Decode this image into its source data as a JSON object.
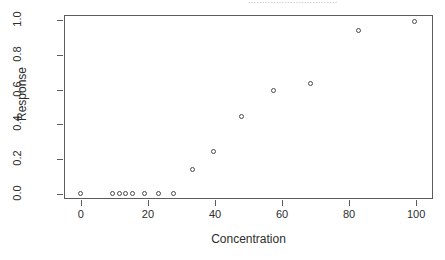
{
  "scan_header": {
    "text": "................................"
  },
  "chart_data": {
    "type": "scatter",
    "title": "",
    "xlabel": "Concentration",
    "ylabel": "Response",
    "xlim": [
      -5,
      105
    ],
    "ylim": [
      -0.03,
      1.03
    ],
    "xticks": [
      0,
      20,
      40,
      60,
      80,
      100
    ],
    "xticklabels": [
      "0",
      "20",
      "40",
      "60",
      "80",
      "100"
    ],
    "yticks": [
      0.0,
      0.2,
      0.4,
      0.6,
      0.8,
      1.0
    ],
    "yticklabels": [
      "0.0",
      "0.2",
      "0.4",
      "0.6",
      "0.8",
      "1.0"
    ],
    "grid": false,
    "legend": null,
    "marker": "open-circle",
    "marker_color": "#494949",
    "x": [
      0,
      9.5,
      11.6,
      13.6,
      15.7,
      19.0,
      23.4,
      27.9,
      33.5,
      39.8,
      48.0,
      57.5,
      68.5,
      83.0,
      99.5
    ],
    "y": [
      0.0,
      0.0,
      0.0,
      0.0,
      0.0,
      0.0,
      0.0,
      0.0,
      0.14,
      0.24,
      0.44,
      0.59,
      0.63,
      0.94,
      0.99
    ],
    "n_points": 15,
    "annotations": []
  }
}
